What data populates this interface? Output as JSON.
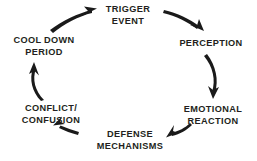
{
  "diagram": {
    "type": "cycle",
    "direction": "clockwise",
    "background_color": "#ffffff",
    "text_color": "#231f20",
    "arrow_color": "#1a1a1a",
    "nodes": [
      {
        "id": "trigger-event",
        "label": "TRIGGER\nEVENT",
        "position": "top"
      },
      {
        "id": "perception",
        "label": "PERCEPTION",
        "position": "top-right"
      },
      {
        "id": "emotional-reaction",
        "label": "EMOTIONAL\nREACTION",
        "position": "bottom-right"
      },
      {
        "id": "defense-mechanisms",
        "label": "DEFENSE\nMECHANISMS",
        "position": "bottom"
      },
      {
        "id": "conflict-confusion",
        "label": "CONFLICT/\nCONFUSION",
        "position": "bottom-left"
      },
      {
        "id": "cool-down-period",
        "label": "COOL DOWN\nPERIOD",
        "position": "top-left"
      }
    ],
    "arrows": [
      {
        "id": "arrow-cool-down-to-trigger",
        "from": "cool-down-period",
        "to": "trigger-event"
      },
      {
        "id": "arrow-trigger-to-perception",
        "from": "trigger-event",
        "to": "perception"
      },
      {
        "id": "arrow-perception-to-emotional",
        "from": "perception",
        "to": "emotional-reaction"
      },
      {
        "id": "arrow-emotional-to-defense",
        "from": "emotional-reaction",
        "to": "defense-mechanisms"
      },
      {
        "id": "arrow-defense-to-conflict",
        "from": "defense-mechanisms",
        "to": "conflict-confusion"
      },
      {
        "id": "arrow-conflict-to-cool-down",
        "from": "conflict-confusion",
        "to": "cool-down-period"
      }
    ]
  }
}
